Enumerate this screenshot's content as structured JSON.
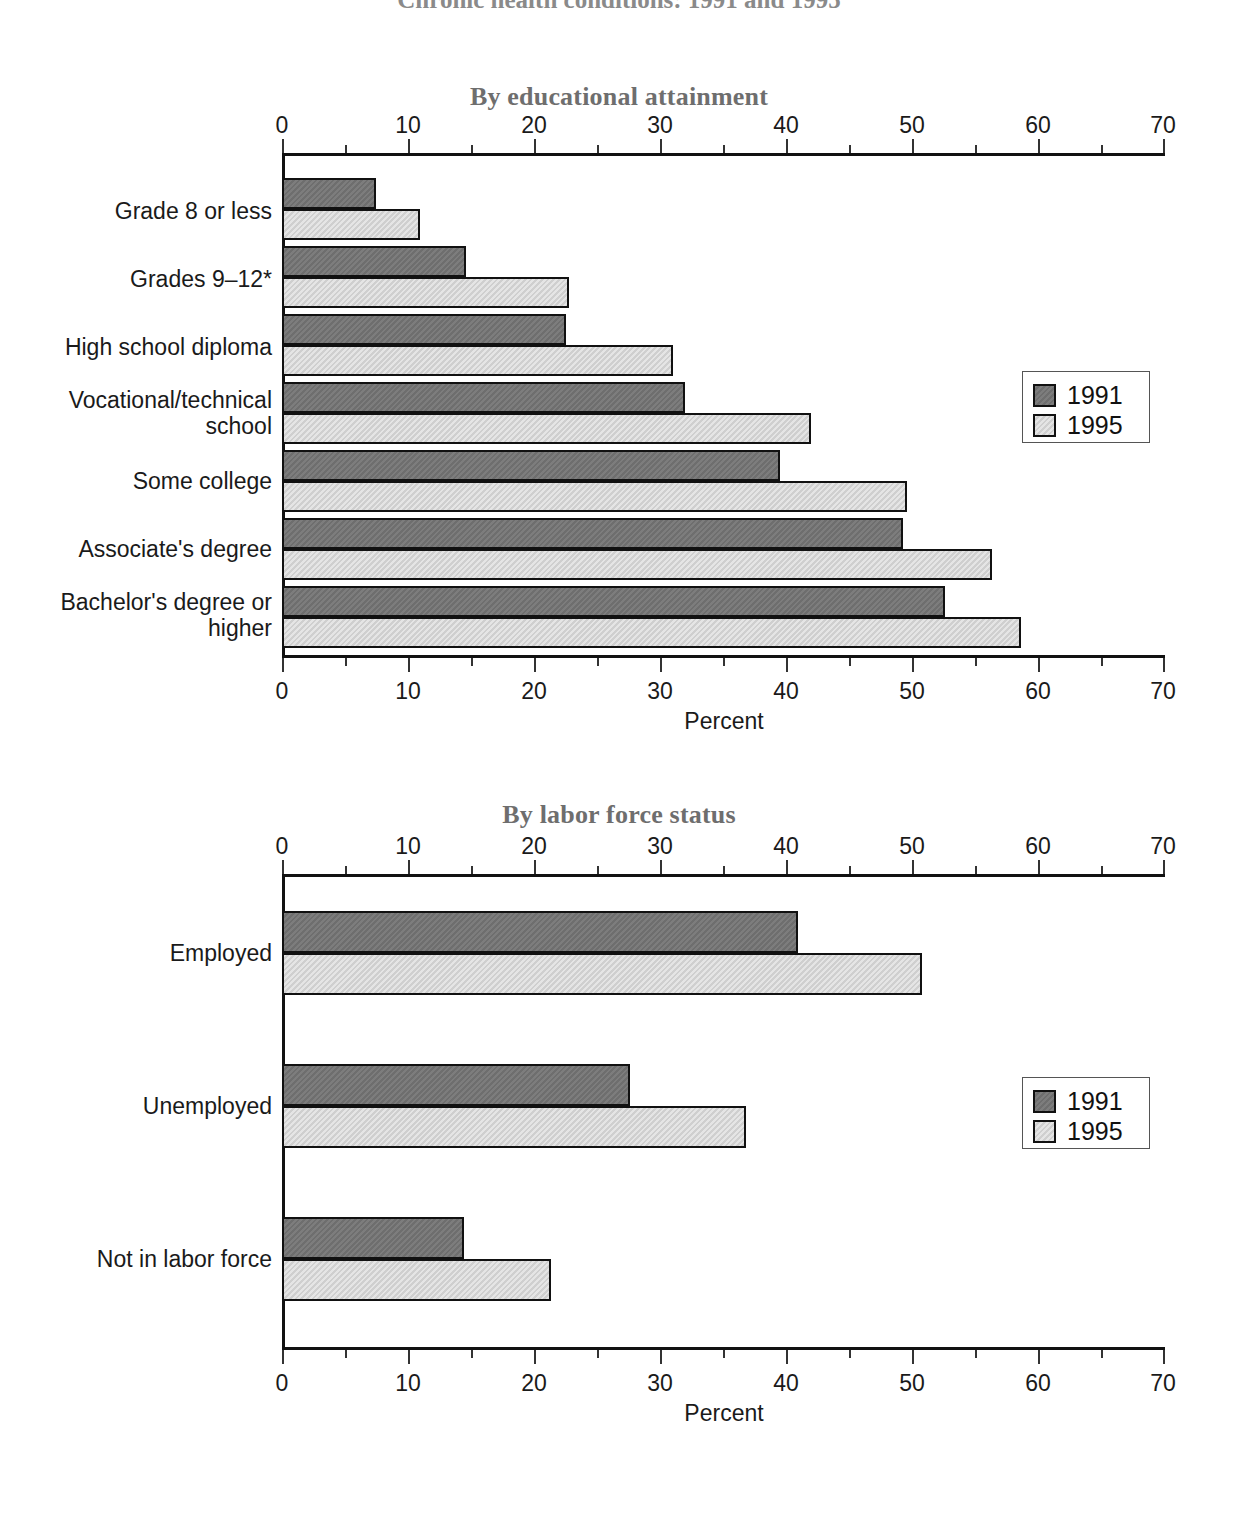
{
  "document": {
    "title_fragment": "Chronic health conditions: 1991 and 1995"
  },
  "legend": {
    "entries": [
      {
        "label": "1991",
        "color": "#6e6e6e"
      },
      {
        "label": "1995",
        "color": "#cfcfcf"
      }
    ]
  },
  "chart_data": [
    {
      "type": "bar",
      "orientation": "horizontal",
      "title": "By educational attainment",
      "xlabel": "Percent",
      "ylabel": "",
      "xlim": [
        0,
        70
      ],
      "xticks": [
        0,
        10,
        20,
        30,
        40,
        50,
        60,
        70
      ],
      "xtick_labels": [
        "0",
        "10",
        "20",
        "30",
        "40",
        "50",
        "60",
        "70"
      ],
      "minor_tick_step": 5,
      "grid": false,
      "legend_position": "right",
      "axis_top": true,
      "categories": [
        "Grade 8 or less",
        "Grades 9–12*",
        "High school diploma",
        "Vocational/technical school",
        "Some college",
        "Associate's degree",
        "Bachelor's degree or higher"
      ],
      "series": [
        {
          "name": "1991",
          "color": "#6e6e6e",
          "values": [
            7.4,
            14.5,
            22.4,
            31.7,
            39.2,
            48.9,
            52.2
          ]
        },
        {
          "name": "1995",
          "color": "#cfcfcf",
          "values": [
            10.9,
            22.6,
            30.8,
            41.7,
            49.2,
            55.9,
            58.2
          ]
        }
      ],
      "footnote": "*"
    },
    {
      "type": "bar",
      "orientation": "horizontal",
      "title": "By labor force status",
      "xlabel": "Percent",
      "ylabel": "",
      "xlim": [
        0,
        70
      ],
      "xticks": [
        0,
        10,
        20,
        30,
        40,
        50,
        60,
        70
      ],
      "xtick_labels": [
        "0",
        "10",
        "20",
        "30",
        "40",
        "50",
        "60",
        "70"
      ],
      "minor_tick_step": 5,
      "grid": false,
      "legend_position": "right",
      "axis_top": true,
      "categories": [
        "Employed",
        "Unemployed",
        "Not in labor force"
      ],
      "series": [
        {
          "name": "1991",
          "color": "#6e6e6e",
          "values": [
            40.6,
            27.4,
            14.3
          ]
        },
        {
          "name": "1995",
          "color": "#cfcfcf",
          "values": [
            50.4,
            36.5,
            21.2
          ]
        }
      ]
    }
  ]
}
